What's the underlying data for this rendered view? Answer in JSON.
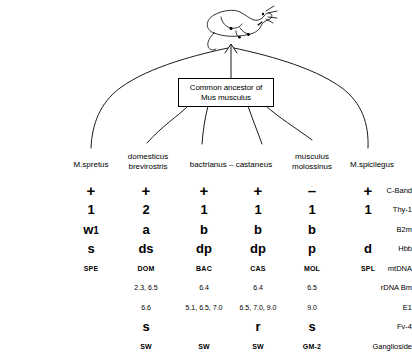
{
  "figure": {
    "apex_icon": "mouse-sketch-icon",
    "ancestor_box": {
      "line1": "Common ancestor of",
      "line2": "Mus musculus"
    }
  },
  "taxa": [
    {
      "id": "spretus",
      "lines": [
        "M.spretus"
      ],
      "x": 91,
      "y": 160
    },
    {
      "id": "domesticus",
      "lines": [
        "domesticus",
        "brevirostris"
      ],
      "x": 148,
      "y": 152
    },
    {
      "id": "bactrianus",
      "lines": [
        "bactrianus – castaneus"
      ],
      "x": 231,
      "y": 160
    },
    {
      "id": "musculus",
      "lines": [
        "musculus",
        "molossinus"
      ],
      "x": 312,
      "y": 152
    },
    {
      "id": "spicilegus",
      "lines": [
        "M.spicilegus"
      ],
      "x": 372,
      "y": 160
    }
  ],
  "columns": [
    {
      "id": "spe",
      "x": 91
    },
    {
      "id": "dom",
      "x": 146
    },
    {
      "id": "bac",
      "x": 204
    },
    {
      "id": "cas",
      "x": 258
    },
    {
      "id": "mol",
      "x": 312
    },
    {
      "id": "spl",
      "x": 368
    }
  ],
  "rows": [
    {
      "label": "C-Band",
      "style": "sz-big",
      "values": [
        "+",
        "+",
        "+",
        "+",
        "–",
        "+"
      ]
    },
    {
      "label": "Thy-1",
      "style": "sz-med",
      "values": [
        "1",
        "2",
        "1",
        "1",
        "1",
        "1"
      ]
    },
    {
      "label": "B2m",
      "style": "sz-med",
      "values": [
        "w1",
        "a",
        "b",
        "b",
        "b",
        ""
      ]
    },
    {
      "label": "Hbb",
      "style": "sz-med",
      "values": [
        "s",
        "ds",
        "dp",
        "dp",
        "p",
        "d"
      ]
    },
    {
      "label": "mtDNA",
      "style": "sz-small",
      "values": [
        "SPE",
        "DOM",
        "BAC",
        "CAS",
        "MOL",
        "SPL"
      ]
    },
    {
      "label": "rDNA Bm",
      "style": "sz-num",
      "values": [
        "",
        "2.3, 6.5",
        "6.4",
        "6.4",
        "6.5",
        ""
      ]
    },
    {
      "label": "E1",
      "style": "sz-num",
      "values": [
        "",
        "6.6",
        "5.1, 6.5, 7.0",
        "6.5, 7.0, 9.0",
        "9.0",
        ""
      ]
    },
    {
      "label": "Fv-4",
      "style": "sz-med",
      "values": [
        "",
        "s",
        "",
        "r",
        "s",
        ""
      ]
    },
    {
      "label": "Ganglioside",
      "style": "sz-small",
      "values": [
        "",
        "SW",
        "SW",
        "SW",
        "GM-2",
        ""
      ]
    }
  ],
  "colors": {
    "background": "#ffffff",
    "ink": "#000000"
  }
}
